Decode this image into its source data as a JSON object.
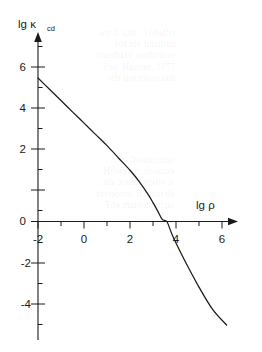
{
  "figure": {
    "name": "kappa-cd-vs-rho-plot",
    "background_color": "#ffffff",
    "ink_color": "#1a1a1a"
  },
  "bleed_through": {
    "block_a": "ydaeb) i   dna ,h tiw\nnoitcnuf eht rof\nsnoitidnoc yradnuob\n7791 ,nesnaH :eeS\ndna snoitcnuf eht",
    "block_b": "noitcudnoC\nesuaceb ,revewoH\nsi ytivitcudnoc eht\neb tsum ti ,erofereht\nlacitamehtam ehT"
  },
  "chart_data": {
    "type": "line",
    "title": "",
    "xlabel": "lg ρ",
    "ylabel": "lg κ",
    "ylabel_sub": "cd",
    "xlim": [
      -2,
      6.4
    ],
    "ylim": [
      -5,
      7.6
    ],
    "grid": false,
    "legend": null,
    "x_major_ticks": [
      -2,
      0,
      2,
      4,
      6
    ],
    "x_minor_ticks": [
      -1,
      1,
      3,
      5
    ],
    "x_tick_labels": [
      "-2",
      "0",
      "2",
      "4",
      "6"
    ],
    "y_major_ticks": [
      -4,
      -2,
      0,
      2,
      4,
      6
    ],
    "y_minor_ticks": [
      -5,
      -3,
      -1,
      1,
      3,
      5,
      7
    ],
    "y_tick_labels": [
      "-4",
      "-2",
      "0",
      "2",
      "4",
      "6"
    ],
    "x_axis_arrow": true,
    "y_axis_arrow": true,
    "zero_crossing_x": 3.6,
    "series": [
      {
        "name": "lg kappa_cd",
        "x": [
          -2.0,
          -1.5,
          -1.0,
          -0.5,
          0.0,
          0.5,
          1.0,
          1.5,
          2.0,
          2.4,
          2.8,
          3.0,
          3.2,
          3.4,
          3.6,
          3.8,
          4.0,
          4.4,
          5.0,
          5.6,
          6.2
        ],
        "y": [
          7.0,
          6.45,
          5.9,
          5.35,
          4.8,
          4.25,
          3.7,
          3.1,
          2.5,
          1.95,
          1.3,
          0.92,
          0.52,
          0.1,
          0.0,
          -0.55,
          -1.05,
          -1.95,
          -3.2,
          -4.3,
          -5.05
        ]
      }
    ]
  }
}
